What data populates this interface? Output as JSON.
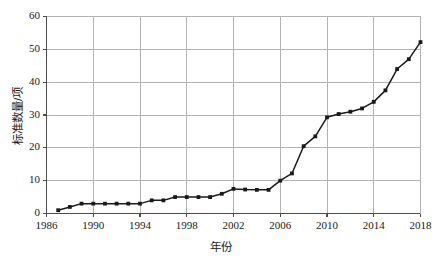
{
  "chart_data": {
    "type": "line",
    "title": "",
    "subtitle": "",
    "xlabel": "年份",
    "ylabel": "标准数量/项",
    "xlim": [
      1986,
      2018
    ],
    "ylim": [
      0,
      60
    ],
    "grid": true,
    "legend": null,
    "marker": "square",
    "line_color": "#1a1a1a",
    "grid_color": "#b3b3b3",
    "axis_color": "#4d4d4d",
    "x_ticks": [
      1986,
      1990,
      1994,
      1998,
      2002,
      2006,
      2010,
      2014,
      2018
    ],
    "x_tick_labels": [
      "1986",
      "1990",
      "1994",
      "1998",
      "2002",
      "2006",
      "2010",
      "2014",
      "2018"
    ],
    "y_ticks": [
      0,
      10,
      20,
      30,
      40,
      50,
      60
    ],
    "y_tick_labels": [
      "0",
      "10",
      "20",
      "30",
      "40",
      "50",
      "60"
    ],
    "series": [
      {
        "name": "标准数量",
        "x": [
          1987,
          1988,
          1989,
          1990,
          1991,
          1992,
          1993,
          1994,
          1995,
          1996,
          1997,
          1998,
          1999,
          2000,
          2001,
          2002,
          2003,
          2004,
          2005,
          2006,
          2007,
          2008,
          2009,
          2010,
          2011,
          2012,
          2013,
          2014,
          2015,
          2016,
          2017,
          2018
        ],
        "values": [
          1,
          2,
          3,
          3,
          3,
          3,
          3,
          3,
          4,
          4,
          5,
          5,
          5,
          5,
          6,
          7.5,
          7.3,
          7.2,
          7.2,
          10,
          12.2,
          20.5,
          23.5,
          29.3,
          30.3,
          31,
          32,
          34,
          37.5,
          44,
          47,
          52.2
        ]
      }
    ]
  }
}
